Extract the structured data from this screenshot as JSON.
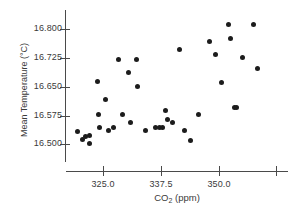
{
  "chart_data": {
    "type": "scatter",
    "title": "",
    "xlabel": "CO2 (ppm)",
    "xlabel_main": "CO",
    "xlabel_sub": "2",
    "xlabel_unit": " (ppm)",
    "ylabel": "Mean Temperature (°C)",
    "xlim": [
      317.0,
      365.0
    ],
    "ylim": [
      16.485,
      16.835
    ],
    "grid": false,
    "legend": null,
    "marker_color": "#1c1c1c",
    "axis_color": "#4a4a4a",
    "xticks": [
      {
        "value": 325.0,
        "label": "325.0"
      },
      {
        "value": 337.5,
        "label": "337.5"
      },
      {
        "value": 350.0,
        "label": "350.0"
      },
      {
        "value": 362.5,
        "label": ""
      }
    ],
    "yticks": [
      {
        "value": 16.8,
        "label": "16.800"
      },
      {
        "value": 16.725,
        "label": "16.725"
      },
      {
        "value": 16.65,
        "label": "16.650"
      },
      {
        "value": 16.575,
        "label": "16.575"
      },
      {
        "value": 16.5,
        "label": "16.500"
      }
    ],
    "points": [
      {
        "x": 319.4,
        "y": 16.534
      },
      {
        "x": 320.6,
        "y": 16.513
      },
      {
        "x": 321.2,
        "y": 16.521
      },
      {
        "x": 322.1,
        "y": 16.522
      },
      {
        "x": 322.0,
        "y": 16.501
      },
      {
        "x": 323.8,
        "y": 16.664
      },
      {
        "x": 324.0,
        "y": 16.578
      },
      {
        "x": 324.2,
        "y": 16.543
      },
      {
        "x": 325.6,
        "y": 16.618
      },
      {
        "x": 326.1,
        "y": 16.535
      },
      {
        "x": 327.3,
        "y": 16.543
      },
      {
        "x": 328.3,
        "y": 16.721
      },
      {
        "x": 329.3,
        "y": 16.578
      },
      {
        "x": 330.6,
        "y": 16.687
      },
      {
        "x": 331.0,
        "y": 16.558
      },
      {
        "x": 332.2,
        "y": 16.721
      },
      {
        "x": 332.4,
        "y": 16.651
      },
      {
        "x": 334.1,
        "y": 16.535
      },
      {
        "x": 336.4,
        "y": 16.545
      },
      {
        "x": 337.2,
        "y": 16.545
      },
      {
        "x": 337.8,
        "y": 16.545
      },
      {
        "x": 338.5,
        "y": 16.587
      },
      {
        "x": 338.9,
        "y": 16.566
      },
      {
        "x": 340.1,
        "y": 16.558
      },
      {
        "x": 341.5,
        "y": 16.747
      },
      {
        "x": 342.6,
        "y": 16.535
      },
      {
        "x": 344.0,
        "y": 16.51
      },
      {
        "x": 345.7,
        "y": 16.578
      },
      {
        "x": 348.0,
        "y": 16.768
      },
      {
        "x": 349.3,
        "y": 16.735
      },
      {
        "x": 350.6,
        "y": 16.661
      },
      {
        "x": 352.1,
        "y": 16.812
      },
      {
        "x": 352.6,
        "y": 16.777
      },
      {
        "x": 353.4,
        "y": 16.597
      },
      {
        "x": 353.9,
        "y": 16.597
      },
      {
        "x": 355.2,
        "y": 16.727
      },
      {
        "x": 357.6,
        "y": 16.812
      },
      {
        "x": 358.4,
        "y": 16.697
      }
    ],
    "point_count": 38
  }
}
